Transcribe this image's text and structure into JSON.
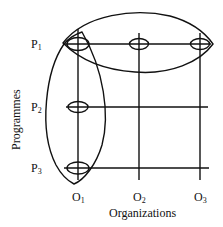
{
  "diagram": {
    "x_axis_title": "Organizations",
    "y_axis_title": "Programmes",
    "rows": [
      {
        "id": "P1",
        "letter": "P",
        "sub": "1"
      },
      {
        "id": "P2",
        "letter": "P",
        "sub": "2"
      },
      {
        "id": "P3",
        "letter": "P",
        "sub": "3"
      }
    ],
    "columns": [
      {
        "id": "O1",
        "letter": "O",
        "sub": "1"
      },
      {
        "id": "O2",
        "letter": "O",
        "sub": "2"
      },
      {
        "id": "O3",
        "letter": "O",
        "sub": "3"
      }
    ],
    "nodes": [
      {
        "row": "P1",
        "col": "O1"
      },
      {
        "row": "P1",
        "col": "O2"
      },
      {
        "row": "P1",
        "col": "O3"
      },
      {
        "row": "P2",
        "col": "O1"
      },
      {
        "row": "P3",
        "col": "O1"
      }
    ],
    "groupings": [
      {
        "name": "row-P1-group",
        "encloses": [
          "P1-O1",
          "P1-O2",
          "P1-O3"
        ]
      },
      {
        "name": "column-O1-group",
        "encloses": [
          "P1-O1",
          "P2-O1",
          "P3-O1"
        ]
      }
    ],
    "colors": {
      "ink": "#111111",
      "background": "#ffffff"
    }
  }
}
